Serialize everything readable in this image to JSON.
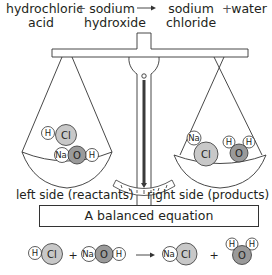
{
  "word_equation": {
    "reactant1": [
      "hydrochloric",
      "acid"
    ],
    "plus1": "+",
    "reactant2": [
      "sodium",
      "hydroxide"
    ],
    "arrow": "→",
    "product1": [
      "sodium",
      "chloride"
    ],
    "plus2": "+",
    "product2": [
      "water"
    ]
  },
  "balance": {
    "left_label": "left side (reactants)",
    "right_label": "right side (products)",
    "left_pan_molecules": [
      {
        "atoms": [
          "H",
          "Cl"
        ]
      },
      {
        "atoms": [
          "Na",
          "O",
          "H"
        ]
      }
    ],
    "right_pan_molecules": [
      {
        "atoms": [
          "Na",
          "Cl"
        ]
      },
      {
        "atoms": [
          "H",
          "O",
          "H"
        ]
      }
    ]
  },
  "caption": "A balanced equation",
  "molecule_equation": {
    "terms": [
      "HCl",
      "+",
      "NaOH",
      "→",
      "NaCl",
      "+",
      "H2O"
    ],
    "atoms": {
      "H": "H",
      "Cl": "Cl",
      "Na": "Na",
      "O": "O"
    },
    "plus": "+"
  },
  "colors": {
    "line": "#333333",
    "needle": "#3a3a3a",
    "cl_fill": "#c8c8c8",
    "o_fill": "#9a9a9a",
    "small_atom_fill": "#ffffff"
  }
}
